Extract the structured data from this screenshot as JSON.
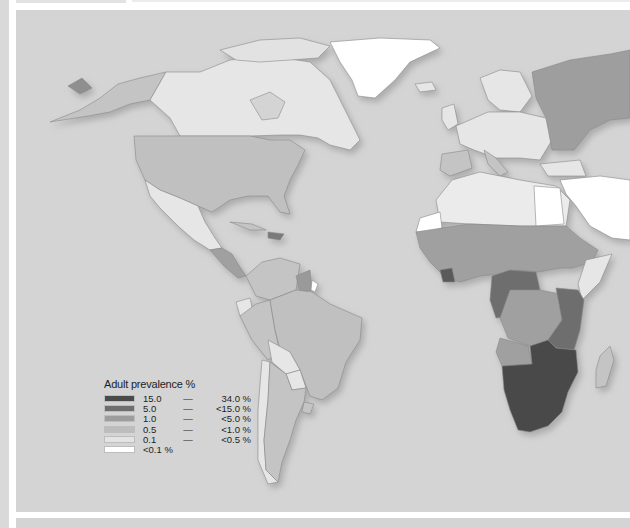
{
  "map": {
    "title": "Adult HIV prevalence world map (Americas, Europe, Africa)",
    "background_color": "#d4d4d4",
    "ocean_color": "#d4d4d4"
  },
  "legend": {
    "title": "Adult prevalence %",
    "classes": [
      {
        "low": "15.0",
        "dash": "—",
        "high": "34.0 %",
        "color": "#4a4a4a"
      },
      {
        "low": "5.0",
        "dash": "—",
        "high": "<15.0 %",
        "color": "#6e6e6e"
      },
      {
        "low": "1.0",
        "dash": "—",
        "high": "<5.0 %",
        "color": "#9d9d9d"
      },
      {
        "low": "0.5",
        "dash": "—",
        "high": "<1.0 %",
        "color": "#bdbdbd"
      },
      {
        "low": "0.1",
        "dash": "—",
        "high": "<0.5 %",
        "color": "#e3e3e3"
      },
      {
        "low": "<0.1 %",
        "dash": "",
        "high": "",
        "color": "#ffffff"
      }
    ]
  },
  "regions": [
    {
      "name": "Alaska",
      "class": "0.5"
    },
    {
      "name": "Canada",
      "class": "0.1"
    },
    {
      "name": "Greenland",
      "class": "<0.1"
    },
    {
      "name": "United States",
      "class": "0.5"
    },
    {
      "name": "Mexico",
      "class": "0.1"
    },
    {
      "name": "Central America",
      "class": "1.0"
    },
    {
      "name": "South America (north)",
      "class": "0.5"
    },
    {
      "name": "Guyana/Suriname",
      "class": "1.0"
    },
    {
      "name": "Brazil",
      "class": "0.5"
    },
    {
      "name": "Bolivia/Paraguay/Chile",
      "class": "0.1"
    },
    {
      "name": "Argentina",
      "class": "0.5"
    },
    {
      "name": "Europe",
      "class": "0.1"
    },
    {
      "name": "Russia",
      "class": "1.0"
    },
    {
      "name": "Iberia/Italy",
      "class": "0.5"
    },
    {
      "name": "North Africa",
      "class": "0.1"
    },
    {
      "name": "Western Sahara",
      "class": "<0.1"
    },
    {
      "name": "West/Central Africa",
      "class": "1.0"
    },
    {
      "name": "Central Africa",
      "class": "5.0"
    },
    {
      "name": "East Africa",
      "class": "5.0"
    },
    {
      "name": "Southern Africa",
      "class": "15.0"
    },
    {
      "name": "Madagascar",
      "class": "0.5"
    },
    {
      "name": "Middle East",
      "class": "<0.1"
    }
  ]
}
